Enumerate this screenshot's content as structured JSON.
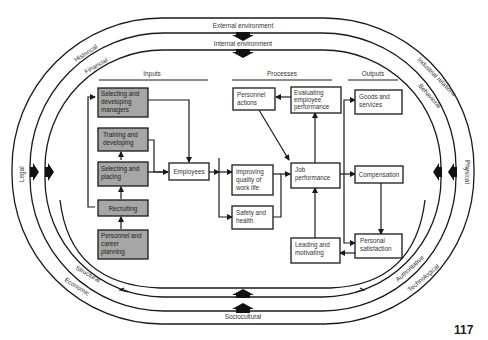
{
  "rings": {
    "outer_label_top": "External environment",
    "inner_label_top": "Internal environment",
    "bottom_label": "Sociocultural"
  },
  "environment_labels": {
    "historical": "Historical",
    "financial": "Financial",
    "industrial_relations": "Industrial relations",
    "behavioral": "Behavioral",
    "legal": "Legal",
    "physical": "Physical",
    "structural": "Structural",
    "economic": "Economic",
    "authoritative": "Authoritative",
    "technological": "Technological"
  },
  "sections": {
    "inputs": "Inputs",
    "processes": "Processes",
    "outputs": "Outputs"
  },
  "inputs": [
    {
      "id": "selecting-developing-managers",
      "lines": [
        "Selecting and",
        "developing",
        "managers"
      ]
    },
    {
      "id": "training-developing",
      "lines": [
        "Training and",
        "developing"
      ]
    },
    {
      "id": "selecting-placing",
      "lines": [
        "Selecting and",
        "placing"
      ]
    },
    {
      "id": "recruiting",
      "lines": [
        "Recruiting"
      ]
    },
    {
      "id": "personnel-career-planning",
      "lines": [
        "Personnel and",
        "career",
        "planning"
      ]
    }
  ],
  "center": {
    "employees": "Employees"
  },
  "processes": [
    {
      "id": "personnel-actions",
      "lines": [
        "Personnel",
        "actions"
      ]
    },
    {
      "id": "evaluating-employee-performance",
      "lines": [
        "Evaluating",
        "employee",
        "performance"
      ]
    },
    {
      "id": "improving-quality-work-life",
      "lines": [
        "Improving",
        "quality of",
        "work life"
      ]
    },
    {
      "id": "safety-health",
      "lines": [
        "Safety and",
        "health"
      ]
    },
    {
      "id": "job-performance",
      "lines": [
        "Job",
        "performance"
      ]
    },
    {
      "id": "leading-motivating",
      "lines": [
        "Leading and",
        "motivating"
      ]
    }
  ],
  "outputs": [
    {
      "id": "goods-services",
      "lines": [
        "Goods and",
        "services"
      ]
    },
    {
      "id": "compensation",
      "lines": [
        "Compensation"
      ]
    },
    {
      "id": "personal-satisfaction",
      "lines": [
        "Personal",
        "satisfaction"
      ]
    }
  ],
  "page_number": "117",
  "colors": {
    "line": "#1a1a1a",
    "grey_box": "#a6a6a6",
    "white_box": "#ffffff",
    "text": "#333333"
  }
}
